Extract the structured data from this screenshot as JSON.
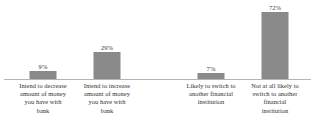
{
  "chart_data": {
    "type": "bar",
    "title": "",
    "subtitle": "",
    "xlabel": "",
    "ylabel": "",
    "ylim": [
      0,
      80
    ],
    "grid": false,
    "legend": false,
    "orientation": "vertical",
    "bar_color": "#8a8a8a",
    "axis_color": "#b5b5b5",
    "categories": [
      "Intend to decrease amount of money you have with bank",
      "Intend to increase amount of money you have with bank",
      "Likely to switch to another financial institution",
      "Not at all likely to switch to another financial institution"
    ],
    "values": [
      9,
      29,
      7,
      72
    ],
    "data_labels": [
      "9%",
      "29%",
      "7%",
      "72%"
    ],
    "bars": [
      {
        "label": "Intend to decrease amount of money you have with bank",
        "label_lines": [
          "Intend to decrease",
          "amount of money",
          "you have with",
          "bank"
        ],
        "value": 9,
        "data_label": "9%"
      },
      {
        "label": "Intend to increase amount of money you have with bank",
        "label_lines": [
          "Intend to increase",
          "amount of money",
          "you have with",
          "bank"
        ],
        "value": 29,
        "data_label": "29%"
      },
      {
        "label": "Likely to switch to another financial institution",
        "label_lines": [
          "Likely to switch to",
          "another financial",
          "institution"
        ],
        "value": 7,
        "data_label": "7%"
      },
      {
        "label": "Not at all likely to switch to another financial institution",
        "label_lines": [
          "Not at all likely to",
          "switch to another",
          "financial",
          "institution"
        ],
        "value": 72,
        "data_label": "72%"
      }
    ]
  }
}
